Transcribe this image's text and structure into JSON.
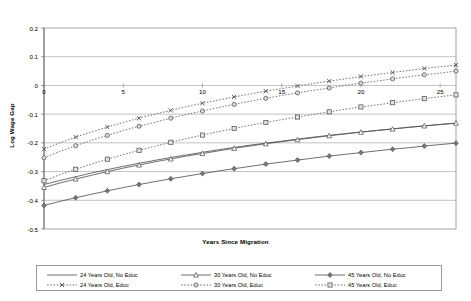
{
  "chart_data": {
    "type": "line",
    "title": "",
    "xlabel": "Years Since Migration",
    "ylabel": "Log Wage Gap",
    "xlim": [
      0,
      26
    ],
    "ylim": [
      -0.5,
      0.2
    ],
    "xticks": [
      0,
      5,
      10,
      15,
      20,
      25
    ],
    "yticks": [
      0.2,
      0.1,
      0,
      -0.1,
      -0.2,
      -0.3,
      -0.4,
      -0.5
    ],
    "ytick_labels": [
      "0.2",
      "0.1",
      "0",
      "-0.1",
      "-0.2",
      "-0.3",
      "-0.4",
      "-0.5"
    ],
    "xtick_labels": [
      "0",
      "5",
      "10",
      "15",
      "20",
      "25"
    ],
    "grid": "horizontal",
    "legend_position": "bottom",
    "x": [
      0,
      1,
      2,
      3,
      4,
      5,
      6,
      7,
      8,
      9,
      10,
      11,
      12,
      13,
      14,
      15,
      16,
      17,
      18,
      19,
      20,
      21,
      22,
      23,
      24,
      25,
      26
    ],
    "series": [
      {
        "name": "24 Years Old, No Educ",
        "line_style": "solid",
        "marker": "none",
        "color": "#555555",
        "values": [
          -0.345,
          -0.331,
          -0.318,
          -0.305,
          -0.293,
          -0.282,
          -0.271,
          -0.261,
          -0.251,
          -0.242,
          -0.233,
          -0.224,
          -0.216,
          -0.208,
          -0.201,
          -0.194,
          -0.187,
          -0.18,
          -0.174,
          -0.168,
          -0.162,
          -0.157,
          -0.151,
          -0.146,
          -0.141,
          -0.136,
          -0.132
        ]
      },
      {
        "name": "30 Years Old, No Educ",
        "line_style": "solid",
        "marker": "triangle",
        "color": "#555555",
        "values": [
          -0.355,
          -0.34,
          -0.326,
          -0.313,
          -0.3,
          -0.288,
          -0.277,
          -0.266,
          -0.256,
          -0.246,
          -0.237,
          -0.228,
          -0.219,
          -0.211,
          -0.203,
          -0.196,
          -0.189,
          -0.182,
          -0.175,
          -0.169,
          -0.163,
          -0.157,
          -0.152,
          -0.146,
          -0.141,
          -0.136,
          -0.131
        ]
      },
      {
        "name": "45 Years Old, No Educ",
        "line_style": "solid",
        "marker": "diamond",
        "color": "#555555",
        "values": [
          -0.418,
          -0.404,
          -0.391,
          -0.379,
          -0.367,
          -0.356,
          -0.345,
          -0.335,
          -0.325,
          -0.316,
          -0.307,
          -0.298,
          -0.29,
          -0.282,
          -0.274,
          -0.267,
          -0.26,
          -0.253,
          -0.246,
          -0.24,
          -0.234,
          -0.228,
          -0.222,
          -0.217,
          -0.211,
          -0.206,
          -0.201
        ]
      },
      {
        "name": "24 Years Old, Educ",
        "line_style": "dotted",
        "marker": "x",
        "color": "#555555",
        "values": [
          -0.222,
          -0.2,
          -0.18,
          -0.162,
          -0.145,
          -0.129,
          -0.114,
          -0.1,
          -0.087,
          -0.074,
          -0.062,
          -0.051,
          -0.04,
          -0.03,
          -0.02,
          -0.011,
          -0.002,
          0.007,
          0.015,
          0.023,
          0.031,
          0.038,
          0.045,
          0.052,
          0.059,
          0.065,
          0.071
        ]
      },
      {
        "name": "30 Years Old, Educ",
        "line_style": "dotted",
        "marker": "circle",
        "color": "#555555",
        "values": [
          -0.252,
          -0.23,
          -0.21,
          -0.191,
          -0.174,
          -0.157,
          -0.142,
          -0.128,
          -0.114,
          -0.101,
          -0.089,
          -0.077,
          -0.066,
          -0.055,
          -0.045,
          -0.035,
          -0.026,
          -0.017,
          -0.009,
          0.0,
          0.008,
          0.015,
          0.023,
          0.03,
          0.037,
          0.043,
          0.05
        ]
      },
      {
        "name": "45 Years Old, Educ",
        "line_style": "dotted",
        "marker": "square",
        "color": "#555555",
        "values": [
          -0.332,
          -0.311,
          -0.292,
          -0.274,
          -0.257,
          -0.241,
          -0.226,
          -0.212,
          -0.198,
          -0.185,
          -0.173,
          -0.161,
          -0.15,
          -0.139,
          -0.129,
          -0.119,
          -0.11,
          -0.101,
          -0.092,
          -0.083,
          -0.075,
          -0.068,
          -0.06,
          -0.053,
          -0.046,
          -0.039,
          -0.033
        ]
      }
    ]
  },
  "legend": {
    "entries": [
      {
        "label": "24 Years Old, No Educ"
      },
      {
        "label": "30 Years Old, No Educ"
      },
      {
        "label": "45 Years Old, No Educ"
      },
      {
        "label": "24 Years Old, Educ"
      },
      {
        "label": "30 Years Old, Educ"
      },
      {
        "label": "45 Years Old, Educ"
      }
    ]
  }
}
